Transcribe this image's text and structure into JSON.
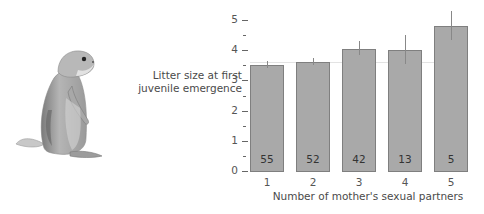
{
  "chart_data": {
    "type": "bar",
    "title": "",
    "xlabel": "Number of mother's sexual partners",
    "ylabel": "Litter size at first juvenile emergence",
    "ylabel_lines": [
      "Litter size at first",
      "juvenile emergence"
    ],
    "categories": [
      "1",
      "2",
      "3",
      "4",
      "5"
    ],
    "values": [
      3.5,
      3.6,
      4.05,
      4.0,
      4.8
    ],
    "error_bars": [
      {
        "low": 3.4,
        "high": 3.65
      },
      {
        "low": 3.5,
        "high": 3.75
      },
      {
        "low": 3.85,
        "high": 4.3
      },
      {
        "low": 3.55,
        "high": 4.5
      },
      {
        "low": 4.35,
        "high": 5.3
      }
    ],
    "sample_sizes": [
      "55",
      "52",
      "42",
      "13",
      "5"
    ],
    "yticks": [
      "0",
      "1",
      "2",
      "3",
      "4",
      "5"
    ],
    "ylim": [
      0,
      5.3
    ],
    "grid": false,
    "legend": null,
    "bar_color": "#a9a9a9",
    "bar_edge_color": "#7f7f7f"
  },
  "illustration": {
    "subject": "prairie dog standing upright"
  }
}
